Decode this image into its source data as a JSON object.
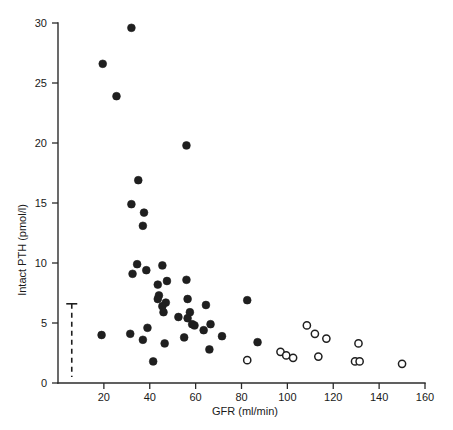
{
  "chart_data": {
    "type": "scatter",
    "title": "",
    "xlabel": "GFR (ml/min)",
    "ylabel": "Intact PTH (pmol/l)",
    "xlim": [
      0,
      160
    ],
    "ylim": [
      0,
      30
    ],
    "xticks": [
      0,
      20,
      40,
      60,
      80,
      100,
      120,
      140,
      160
    ],
    "yticks": [
      0,
      5,
      10,
      15,
      20,
      25,
      30
    ],
    "xtick_labels": [
      "0",
      "20",
      "40",
      "60",
      "80",
      "100",
      "120",
      "140",
      "160"
    ],
    "ytick_labels": [
      "0",
      "5",
      "10",
      "15",
      "20",
      "25",
      "30"
    ],
    "grid": false,
    "legend": "none",
    "marker_colors": {
      "filled": "#1f1f1f",
      "open_fill": "#ffffff",
      "open_stroke": "#1f1f1f",
      "axis": "#2b2b2b"
    },
    "series": [
      {
        "name": "filled-circles",
        "marker": "filled-circle",
        "points": [
          [
            32.0,
            29.6
          ],
          [
            19.5,
            26.6
          ],
          [
            25.5,
            23.9
          ],
          [
            56.0,
            19.8
          ],
          [
            35.0,
            16.9
          ],
          [
            32.0,
            14.9
          ],
          [
            37.5,
            14.2
          ],
          [
            37.0,
            13.1
          ],
          [
            34.5,
            9.9
          ],
          [
            45.5,
            9.8
          ],
          [
            32.5,
            9.1
          ],
          [
            38.5,
            9.4
          ],
          [
            56.0,
            8.6
          ],
          [
            43.5,
            8.2
          ],
          [
            47.5,
            8.5
          ],
          [
            44.0,
            7.3
          ],
          [
            43.5,
            7.0
          ],
          [
            56.5,
            7.0
          ],
          [
            82.5,
            6.9
          ],
          [
            47.0,
            6.7
          ],
          [
            45.5,
            6.4
          ],
          [
            64.5,
            6.5
          ],
          [
            46.0,
            5.9
          ],
          [
            57.5,
            5.9
          ],
          [
            52.5,
            5.5
          ],
          [
            56.5,
            5.4
          ],
          [
            58.5,
            4.9
          ],
          [
            59.5,
            4.8
          ],
          [
            66.5,
            4.9
          ],
          [
            71.5,
            3.9
          ],
          [
            63.5,
            4.4
          ],
          [
            39.0,
            4.6
          ],
          [
            19.0,
            4.0
          ],
          [
            31.5,
            4.1
          ],
          [
            55.0,
            3.8
          ],
          [
            37.0,
            3.6
          ],
          [
            46.5,
            3.3
          ],
          [
            87.0,
            3.4
          ],
          [
            66.0,
            2.8
          ],
          [
            41.5,
            1.8
          ]
        ]
      },
      {
        "name": "open-circles",
        "marker": "open-circle",
        "points": [
          [
            108.5,
            4.8
          ],
          [
            112.0,
            4.1
          ],
          [
            117.0,
            3.7
          ],
          [
            131.0,
            3.3
          ],
          [
            97.0,
            2.6
          ],
          [
            99.5,
            2.3
          ],
          [
            102.5,
            2.1
          ],
          [
            113.5,
            2.2
          ],
          [
            129.5,
            1.8
          ],
          [
            131.5,
            1.8
          ],
          [
            82.5,
            1.9
          ],
          [
            150.0,
            1.6
          ]
        ]
      }
    ],
    "annotations": [
      {
        "name": "reference-range-bracket",
        "type": "dashed-vertical-with-cap",
        "x": 6.0,
        "y_top": 6.6,
        "y_bottom": 0.5,
        "cap_half_width": 2.4
      }
    ]
  },
  "axes": {
    "x_title": "GFR (ml/min)",
    "y_title": "Intact PTH (pmol/l)"
  }
}
